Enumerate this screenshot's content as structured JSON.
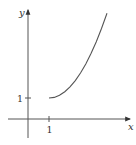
{
  "chart_data": {
    "type": "line",
    "title": "",
    "xlabel": "x",
    "ylabel": "y",
    "x_ticks": [
      {
        "value": 1,
        "label": "1"
      }
    ],
    "y_ticks": [
      {
        "value": 1,
        "label": "1"
      }
    ],
    "xlim": [
      -0.95,
      4.95
    ],
    "ylim": [
      -0.9,
      5.2
    ],
    "grid": false,
    "legend": null,
    "series": [
      {
        "name": "curve",
        "description": "increasing concave-up curve starting at (1,1), approx y = 1 + 0.53(x-1)^2",
        "x": [
          1.0,
          1.25,
          1.5,
          1.75,
          2.0,
          2.25,
          2.5,
          2.75,
          3.0,
          3.25,
          3.5,
          3.76
        ],
        "y": [
          1.0,
          1.03,
          1.13,
          1.3,
          1.53,
          1.83,
          2.19,
          2.62,
          3.12,
          3.68,
          4.31,
          5.04
        ]
      }
    ],
    "colors": {
      "axis": "#555555",
      "curve": "#555555",
      "text": "#333333"
    }
  },
  "labels": {
    "x_axis": "x",
    "y_axis": "y",
    "x_tick_1": "1",
    "y_tick_1": "1"
  }
}
